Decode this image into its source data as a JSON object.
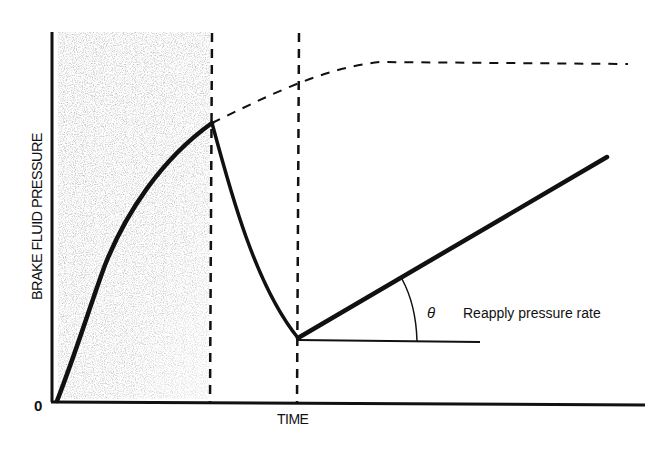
{
  "diagram": {
    "y_axis_label": "BRAKE FLUID PRESSURE",
    "x_axis_label": "TIME",
    "origin_label": "0",
    "angle_symbol": "θ",
    "annotation": "Reapply pressure rate",
    "colors": {
      "line": "#111111",
      "shade": "#9a9a9a",
      "background": "#ffffff"
    },
    "phases": [
      {
        "name": "pressure-apply",
        "shaded": true,
        "description": "Pressure rises (shaded region)"
      },
      {
        "name": "pressure-release",
        "shaded": false,
        "description": "Pressure drops rapidly"
      },
      {
        "name": "pressure-reapply",
        "shaded": false,
        "description": "Pressure reapplied at rate θ"
      }
    ],
    "curves": {
      "apply": "solid thick rising curve from origin to peak",
      "unrestricted": "dashed curve continuing from peak and leveling off",
      "release": "solid curve falling from peak to minimum",
      "reapply": "solid straight line rising at angle θ",
      "reference": "horizontal reference line from minimum"
    }
  }
}
